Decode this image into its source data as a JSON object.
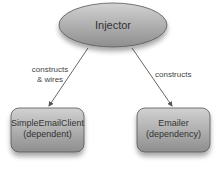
{
  "diagram": {
    "nodes": [
      {
        "id": "injector",
        "label": "Injector",
        "shape": "ellipse"
      },
      {
        "id": "simple-email-client",
        "label": "SimpleEmailClient",
        "sublabel": "(dependent)",
        "shape": "rounded-rect"
      },
      {
        "id": "emailer",
        "label": "Emailer",
        "sublabel": "(dependency)",
        "shape": "rounded-rect"
      }
    ],
    "edges": [
      {
        "from": "injector",
        "to": "simple-email-client",
        "label_line1": "constructs",
        "label_line2": "& wires"
      },
      {
        "from": "injector",
        "to": "emailer",
        "label_line1": "constructs"
      }
    ],
    "colors": {
      "fill_light": "#d4d4d4",
      "fill_dark": "#8c8c8c",
      "stroke": "#555555",
      "edge": "#555555"
    }
  }
}
